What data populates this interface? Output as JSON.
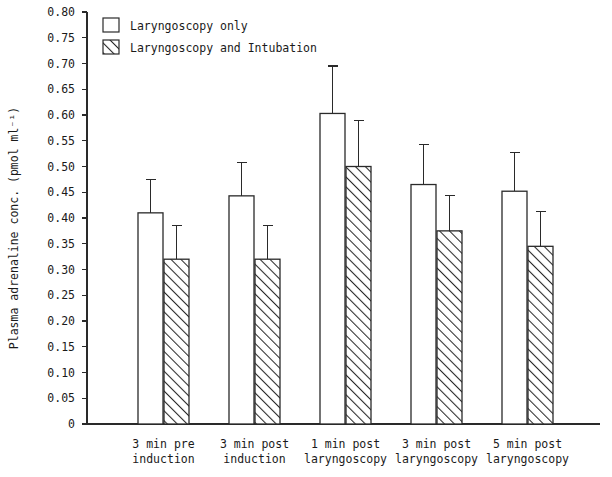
{
  "chart_data": {
    "type": "bar",
    "title": "",
    "xlabel": "",
    "ylabel": "Plasma adrenaline conc. (pmol ml⁻¹)",
    "ylim": [
      0,
      0.8
    ],
    "grid": false,
    "legend_position": "top-left",
    "categories": [
      "3 min pre\ninduction",
      "3 min post\ninduction",
      "1 min post\nlaryngoscopy",
      "3 min post\nlaryngoscopy",
      "5 min post\nlaryngoscopy"
    ],
    "category_lines": [
      [
        "3 min pre",
        "induction"
      ],
      [
        "3 min post",
        "induction"
      ],
      [
        "1 min post",
        "laryngoscopy"
      ],
      [
        "3 min post",
        "laryngoscopy"
      ],
      [
        "5 min post",
        "laryngoscopy"
      ]
    ],
    "ytick_labels": [
      "0.80",
      "0.75",
      "0.70",
      "0.65",
      "0.60",
      "0.55",
      "0.50",
      "0.45",
      "0.40",
      "0.35",
      "0.30",
      "0.25",
      "0.20",
      "0.15",
      "0.10",
      "0.05",
      "0"
    ],
    "ytick_values": [
      0.8,
      0.75,
      0.7,
      0.65,
      0.6,
      0.55,
      0.5,
      0.45,
      0.4,
      0.35,
      0.3,
      0.25,
      0.2,
      0.15,
      0.1,
      0.05,
      0
    ],
    "series": [
      {
        "name": "Laryngoscopy only",
        "style": "open",
        "values": [
          0.41,
          0.443,
          0.603,
          0.465,
          0.452
        ],
        "errors_upper": [
          0.475,
          0.508,
          0.695,
          0.543,
          0.527
        ]
      },
      {
        "name": "Laryngoscopy and Intubation",
        "style": "hatched",
        "values": [
          0.32,
          0.32,
          0.5,
          0.375,
          0.345
        ],
        "errors_upper": [
          0.385,
          0.385,
          0.59,
          0.443,
          0.412
        ]
      }
    ]
  },
  "legend": {
    "items": [
      {
        "label": "Laryngoscopy only",
        "style": "open"
      },
      {
        "label": "Laryngoscopy and Intubation",
        "style": "hatched"
      }
    ]
  },
  "colors": {
    "ink": "#2a2a2a",
    "background": "#ffffff",
    "bar_open_fill": "#ffffff",
    "bar_hatch_fill": "#ffffff"
  }
}
